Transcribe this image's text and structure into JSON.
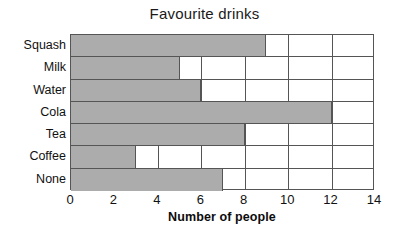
{
  "chart_data": {
    "type": "bar",
    "orientation": "horizontal",
    "title": "Favourite drinks",
    "xlabel": "Number of people",
    "ylabel": "",
    "categories": [
      "Squash",
      "Milk",
      "Water",
      "Cola",
      "Tea",
      "Coffee",
      "None"
    ],
    "values": [
      9,
      5,
      6,
      12,
      8,
      3,
      7
    ],
    "xlim": [
      0,
      14
    ],
    "xticks": [
      0,
      2,
      4,
      6,
      8,
      10,
      12,
      14
    ],
    "xtick_labels": [
      "0",
      "2",
      "4",
      "6",
      "8",
      "10",
      "12",
      "14"
    ],
    "grid": true,
    "grid_axis": "x",
    "legend": false,
    "bar_color": "#abacab",
    "outline_color": "#555555",
    "background_color": "#ffffff"
  }
}
